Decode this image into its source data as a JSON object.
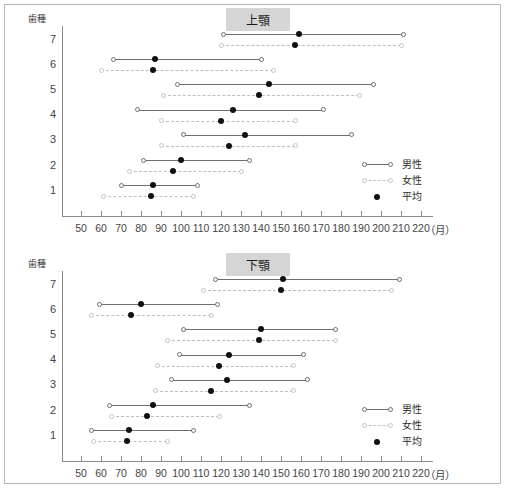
{
  "chart_data": [
    {
      "type": "line",
      "title": "上顎",
      "xlabel": "（月）",
      "ylabel": "歯種",
      "xlim": [
        40.5,
        226
      ],
      "xticks": [
        50,
        60,
        70,
        80,
        90,
        100,
        110,
        120,
        130,
        140,
        150,
        160,
        170,
        180,
        190,
        200,
        210,
        220
      ],
      "categories": [
        "7",
        "6",
        "5",
        "4",
        "3",
        "2",
        "1"
      ],
      "legend": [
        {
          "key": "male",
          "label": "男性"
        },
        {
          "key": "female",
          "label": "女性"
        },
        {
          "key": "mean",
          "label": "平均"
        }
      ],
      "rows": [
        {
          "tooth": "7",
          "male": {
            "min": 121,
            "max": 211,
            "mean": 159
          },
          "female": {
            "min": 120,
            "max": 210,
            "mean": 157
          }
        },
        {
          "tooth": "6",
          "male": {
            "min": 66,
            "max": 140,
            "mean": 87
          },
          "female": {
            "min": 60,
            "max": 146,
            "mean": 86
          }
        },
        {
          "tooth": "5",
          "male": {
            "min": 98,
            "max": 196,
            "mean": 144
          },
          "female": {
            "min": 91,
            "max": 189,
            "mean": 139
          }
        },
        {
          "tooth": "4",
          "male": {
            "min": 78,
            "max": 171,
            "mean": 126
          },
          "female": {
            "min": 90,
            "max": 157,
            "mean": 120
          }
        },
        {
          "tooth": "3",
          "male": {
            "min": 101,
            "max": 185,
            "mean": 132
          },
          "female": {
            "min": 90,
            "max": 157,
            "mean": 124
          }
        },
        {
          "tooth": "2",
          "male": {
            "min": 81,
            "max": 134,
            "mean": 100
          },
          "female": {
            "min": 74,
            "max": 130,
            "mean": 96
          }
        },
        {
          "tooth": "1",
          "male": {
            "min": 70,
            "max": 108,
            "mean": 86
          },
          "female": {
            "min": 61,
            "max": 106,
            "mean": 85
          }
        }
      ]
    },
    {
      "type": "line",
      "title": "下顎",
      "xlabel": "（月）",
      "ylabel": "歯種",
      "xlim": [
        40.5,
        226
      ],
      "xticks": [
        50,
        60,
        70,
        80,
        90,
        100,
        110,
        120,
        130,
        140,
        150,
        160,
        170,
        180,
        190,
        200,
        210,
        220
      ],
      "categories": [
        "7",
        "6",
        "5",
        "4",
        "3",
        "2",
        "1"
      ],
      "legend": [
        {
          "key": "male",
          "label": "男性"
        },
        {
          "key": "female",
          "label": "女性"
        },
        {
          "key": "mean",
          "label": "平均"
        }
      ],
      "rows": [
        {
          "tooth": "7",
          "male": {
            "min": 117,
            "max": 209,
            "mean": 151
          },
          "female": {
            "min": 111,
            "max": 205,
            "mean": 150
          }
        },
        {
          "tooth": "6",
          "male": {
            "min": 59,
            "max": 118,
            "mean": 80
          },
          "female": {
            "min": 55,
            "max": 115,
            "mean": 75
          }
        },
        {
          "tooth": "5",
          "male": {
            "min": 101,
            "max": 177,
            "mean": 140
          },
          "female": {
            "min": 93,
            "max": 177,
            "mean": 139
          }
        },
        {
          "tooth": "4",
          "male": {
            "min": 99,
            "max": 161,
            "mean": 124
          },
          "female": {
            "min": 88,
            "max": 156,
            "mean": 119
          }
        },
        {
          "tooth": "3",
          "male": {
            "min": 95,
            "max": 163,
            "mean": 123
          },
          "female": {
            "min": 87,
            "max": 156,
            "mean": 115
          }
        },
        {
          "tooth": "2",
          "male": {
            "min": 64,
            "max": 134,
            "mean": 86
          },
          "female": {
            "min": 65,
            "max": 119,
            "mean": 83
          }
        },
        {
          "tooth": "1",
          "male": {
            "min": 55,
            "max": 106,
            "mean": 74
          },
          "female": {
            "min": 56,
            "max": 93,
            "mean": 73
          }
        }
      ]
    }
  ]
}
